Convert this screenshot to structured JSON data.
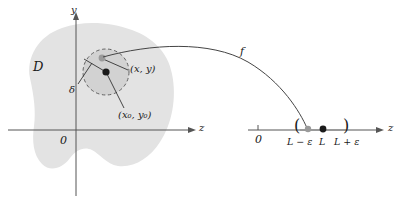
{
  "figure": {
    "colors": {
      "region_fill": "#e3e3e3",
      "disk_fill": "#cfcfcf",
      "axis": "#555555",
      "curve": "#444444",
      "dashed": "#555555",
      "point_dark": "#1a1a1a",
      "point_gray": "#9a9a9a",
      "text": "#1a1a1a"
    }
  },
  "domain_plane": {
    "region_label": "D",
    "y_axis_label": "y",
    "z_axis_label": "z",
    "origin_label": "0",
    "radius_label": "δ",
    "moving_point_label": "(x, y)",
    "center_point_label": "(x₀, y₀)"
  },
  "mapping": {
    "function_label": "f"
  },
  "number_line": {
    "axis_label": "z",
    "origin_label": "0",
    "left_bracket": "(",
    "right_bracket": ")",
    "lower_bound_label": "L − ε",
    "limit_label": "L",
    "upper_bound_label": "L + ε"
  }
}
